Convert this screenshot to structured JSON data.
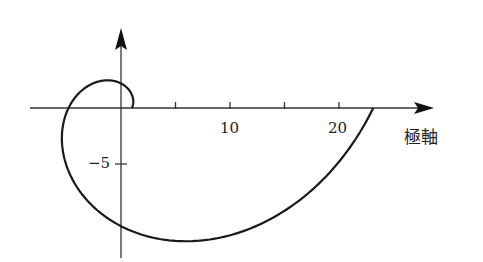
{
  "chart_data": {
    "type": "line",
    "title": "",
    "equation": "r = e^(theta/2)",
    "theta_range": [
      0,
      6.2832
    ],
    "xlabel": "極軸",
    "ylabel": "",
    "x_ticks": [
      5,
      10,
      15,
      20
    ],
    "x_tick_labels": [
      {
        "value": 10,
        "label": "10"
      },
      {
        "value": 20,
        "label": "20"
      }
    ],
    "y_ticks": [
      -5
    ],
    "y_tick_labels": [
      {
        "value": -5,
        "label": "−5"
      }
    ],
    "xlim": [
      -8.4,
      28.4
    ],
    "ylim": [
      -13.5,
      7.2
    ],
    "grid": false,
    "legend": null,
    "key_points": [
      {
        "theta": "0",
        "x": 1.0,
        "y": 0
      },
      {
        "theta": "π/2",
        "x": 0,
        "y": 2.19
      },
      {
        "theta": "π",
        "x": -4.81,
        "y": 0
      },
      {
        "theta": "3π/2",
        "x": 0,
        "y": -10.55
      },
      {
        "theta": "2π",
        "x": 23.14,
        "y": 0
      }
    ],
    "line_color": "#1a1a1a"
  },
  "axes": {
    "x_label": "極軸",
    "tick_10": "10",
    "tick_20": "20",
    "tick_neg5": "−5"
  }
}
